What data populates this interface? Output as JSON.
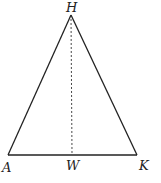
{
  "diagram": {
    "type": "isosceles-triangle-with-altitude",
    "points": {
      "H": {
        "label": "H",
        "x": 71,
        "y": 15
      },
      "A": {
        "label": "A",
        "x": 8,
        "y": 155
      },
      "K": {
        "label": "K",
        "x": 137,
        "y": 155
      },
      "W": {
        "label": "W",
        "x": 72,
        "y": 155
      }
    },
    "segments": [
      {
        "from": "H",
        "to": "A",
        "style": "solid"
      },
      {
        "from": "H",
        "to": "K",
        "style": "solid"
      },
      {
        "from": "A",
        "to": "K",
        "style": "solid"
      },
      {
        "from": "H",
        "to": "W",
        "style": "dashed"
      }
    ],
    "colors": {
      "stroke": "#222222",
      "background": "#ffffff"
    }
  }
}
